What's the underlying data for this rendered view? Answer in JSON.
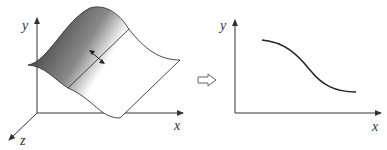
{
  "left_figure": {
    "description": "3D surface with cross-section line",
    "axes": {
      "y_label": "y",
      "x_label": "x",
      "z_label": "z"
    },
    "gradient": {
      "dark": "#2a2a2a",
      "light": "#ffffff"
    }
  },
  "transform_arrow": {
    "icon": "hollow-right-arrow"
  },
  "right_figure": {
    "description": "2D profile curve (decreasing sigmoid)",
    "axes": {
      "y_label": "y",
      "x_label": "x"
    }
  },
  "colors": {
    "line": "#333333"
  }
}
